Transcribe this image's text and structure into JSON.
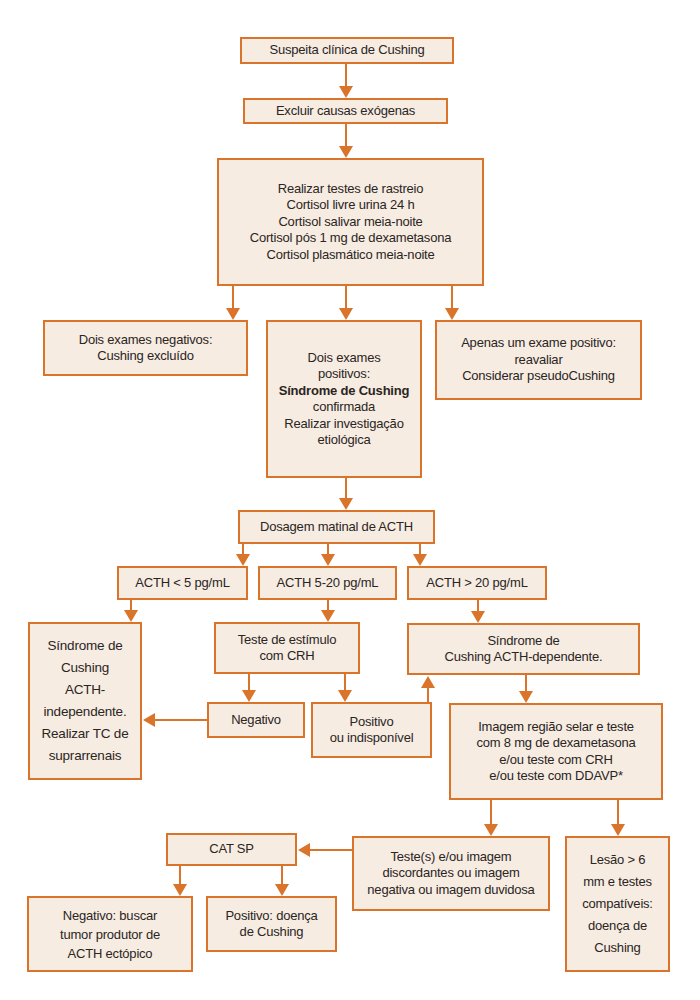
{
  "diagram": {
    "type": "flowchart",
    "accent_color": "#d9742a",
    "box_fill": "#f6ece2",
    "text_color": "#2b2522",
    "nodes": {
      "suspicion": {
        "lines": [
          "Suspeita clínica de Cushing"
        ]
      },
      "exclude": {
        "lines": [
          "Excluir causas exógenas"
        ]
      },
      "screening": {
        "lines": [
          "Realizar testes de rastreio",
          "Cortisol livre urina 24 h",
          "Cortisol salivar meia-noite",
          "Cortisol pós 1 mg de dexametasona",
          "Cortisol plasmático meia-noite"
        ]
      },
      "two_negative": {
        "lines": [
          "Dois exames negativos:",
          "Cushing excluído"
        ]
      },
      "two_positive": {
        "lines": [
          "Dois exames",
          "positivos:",
          "Síndrome de Cushing",
          "confirmada",
          "Realizar investigação",
          "etiológica"
        ],
        "bold_line": "Síndrome de Cushing"
      },
      "one_positive": {
        "lines": [
          "Apenas um exame positivo:",
          "reavaliar",
          "Considerar pseudoCushing"
        ]
      },
      "acth_dosage": {
        "lines": [
          "Dosagem matinal de ACTH"
        ]
      },
      "acth_low": {
        "lines": [
          "ACTH < 5 pg/mL"
        ]
      },
      "acth_mid": {
        "lines": [
          "ACTH 5-20 pg/mL"
        ]
      },
      "acth_high": {
        "lines": [
          "ACTH > 20 pg/mL"
        ]
      },
      "acth_independent": {
        "lines": [
          "Síndrome de",
          "Cushing",
          "ACTH-",
          "independente.",
          "Realizar TC de",
          "suprarrenais"
        ]
      },
      "crh_test": {
        "lines": [
          "Teste de estímulo",
          "com CRH"
        ]
      },
      "negative": {
        "lines": [
          "Negativo"
        ]
      },
      "positive": {
        "lines": [
          "Positivo",
          "ou indisponível"
        ]
      },
      "acth_dependent": {
        "lines": [
          "Síndrome de",
          "Cushing ACTH-dependente."
        ]
      },
      "imaging": {
        "lines": [
          "Imagem região selar e teste",
          "com 8 mg de dexametasona",
          "e/ou teste com CRH",
          "e/ou teste com DDAVP*"
        ]
      },
      "cat_sp": {
        "lines": [
          "CAT SP"
        ]
      },
      "discordant": {
        "lines": [
          "Teste(s) e/ou imagem",
          "discordantes ou imagem",
          "negativa ou imagem duvidosa"
        ]
      },
      "lesion": {
        "lines": [
          "Lesão > 6",
          "mm e testes",
          "compatíveis:",
          "doença de",
          "Cushing"
        ]
      },
      "cat_negative": {
        "lines": [
          "Negativo: buscar",
          "tumor produtor de",
          "ACTH ectópico"
        ]
      },
      "cat_positive": {
        "lines": [
          "Positivo: doença",
          "de Cushing"
        ]
      }
    },
    "edges": [
      [
        "suspicion",
        "exclude"
      ],
      [
        "exclude",
        "screening"
      ],
      [
        "screening",
        "two_negative"
      ],
      [
        "screening",
        "two_positive"
      ],
      [
        "screening",
        "one_positive"
      ],
      [
        "two_positive",
        "acth_dosage"
      ],
      [
        "acth_dosage",
        "acth_low"
      ],
      [
        "acth_dosage",
        "acth_mid"
      ],
      [
        "acth_dosage",
        "acth_high"
      ],
      [
        "acth_low",
        "acth_independent"
      ],
      [
        "acth_mid",
        "crh_test"
      ],
      [
        "acth_high",
        "acth_dependent"
      ],
      [
        "crh_test",
        "negative"
      ],
      [
        "crh_test",
        "positive"
      ],
      [
        "negative",
        "acth_independent"
      ],
      [
        "positive",
        "acth_dependent"
      ],
      [
        "acth_dependent",
        "imaging"
      ],
      [
        "imaging",
        "discordant"
      ],
      [
        "imaging",
        "lesion"
      ],
      [
        "discordant",
        "cat_sp"
      ],
      [
        "cat_sp",
        "cat_negative"
      ],
      [
        "cat_sp",
        "cat_positive"
      ]
    ]
  }
}
